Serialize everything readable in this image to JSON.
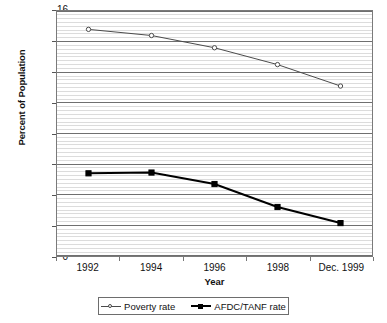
{
  "chart_data": {
    "type": "line",
    "title": "",
    "xlabel": "Year",
    "ylabel": "Percent of Population",
    "categories": [
      "1992",
      "1994",
      "1996",
      "1998",
      "Dec. 1999"
    ],
    "x_tick_labels": [
      "1992",
      "1994",
      "1996",
      "1998",
      "Dec. 1999"
    ],
    "y_tick_labels": [
      "0",
      "2",
      "4",
      "6",
      "8",
      "10",
      "12",
      "14",
      "16"
    ],
    "y_ticks": [
      0,
      2,
      4,
      6,
      8,
      10,
      12,
      14,
      16
    ],
    "ylim": [
      0,
      16
    ],
    "grid": true,
    "minor_grid": true,
    "minor_grid_step": 0.25,
    "legend_position": "bottom",
    "series": [
      {
        "name": "Poverty rate",
        "marker": "open-circle",
        "color": "#4a4a4a",
        "values": [
          14.8,
          14.4,
          13.6,
          12.5,
          11.1
        ]
      },
      {
        "name": "AFDC/TANF rate",
        "marker": "filled-square",
        "color": "#000000",
        "values": [
          5.4,
          5.45,
          4.7,
          3.2,
          2.15
        ]
      }
    ]
  },
  "legend": {
    "entries": [
      {
        "label": "Poverty rate"
      },
      {
        "label": "AFDC/TANF rate"
      }
    ]
  },
  "axes": {
    "y_title": "Percent of Population",
    "x_title": "Year"
  },
  "colors": {
    "poverty_line": "#4a4a4a",
    "afdc_line": "#000000",
    "major_grid": "#6f6f6f",
    "minor_grid": "#dcdcdc",
    "axis_border": "#7a7a7a",
    "text": "#111111"
  }
}
